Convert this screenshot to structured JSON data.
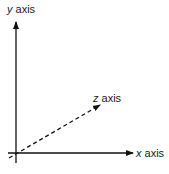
{
  "diagram": {
    "type": "3d-coordinate-axes",
    "axes": {
      "y": {
        "var": "y",
        "word": "axis",
        "style": "solid",
        "direction": "up"
      },
      "x": {
        "var": "x",
        "word": "axis",
        "style": "solid",
        "direction": "right"
      },
      "z": {
        "var": "z",
        "word": "axis",
        "style": "dashed",
        "direction": "diagonal-up-right"
      }
    },
    "colors": {
      "line": "#111111",
      "text": "#1a1a1a",
      "background": "#ffffff"
    }
  }
}
